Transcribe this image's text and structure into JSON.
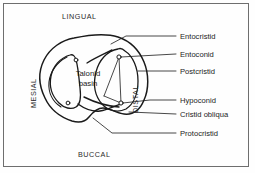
{
  "figure": {
    "border_color": "#6e6e6e",
    "background": "#fefefe",
    "line_color": "#1a1a1a"
  },
  "orientation_labels": [
    {
      "name": "lingual",
      "text": "LINGUAL",
      "position": "top"
    },
    {
      "name": "buccal",
      "text": "BUCCAL",
      "position": "bottom"
    },
    {
      "name": "mesial",
      "text": "MESIAL",
      "position": "left",
      "rotated": true
    },
    {
      "name": "distal",
      "text": "DISTAL",
      "position": "inner-right",
      "rotated": true
    }
  ],
  "interior_labels": [
    {
      "name": "talonid-basin",
      "line1": "Talonid",
      "line2": "basin"
    }
  ],
  "callouts": [
    {
      "name": "entocristid",
      "text": "Entocristid"
    },
    {
      "name": "entoconid",
      "text": "Entoconid"
    },
    {
      "name": "postcristid",
      "text": "Postcristid"
    },
    {
      "name": "hypoconid",
      "text": "Hypoconid"
    },
    {
      "name": "cristid-obliqua",
      "text": "Cristid obliqua"
    },
    {
      "name": "protocristid",
      "text": "Protocristid"
    }
  ]
}
